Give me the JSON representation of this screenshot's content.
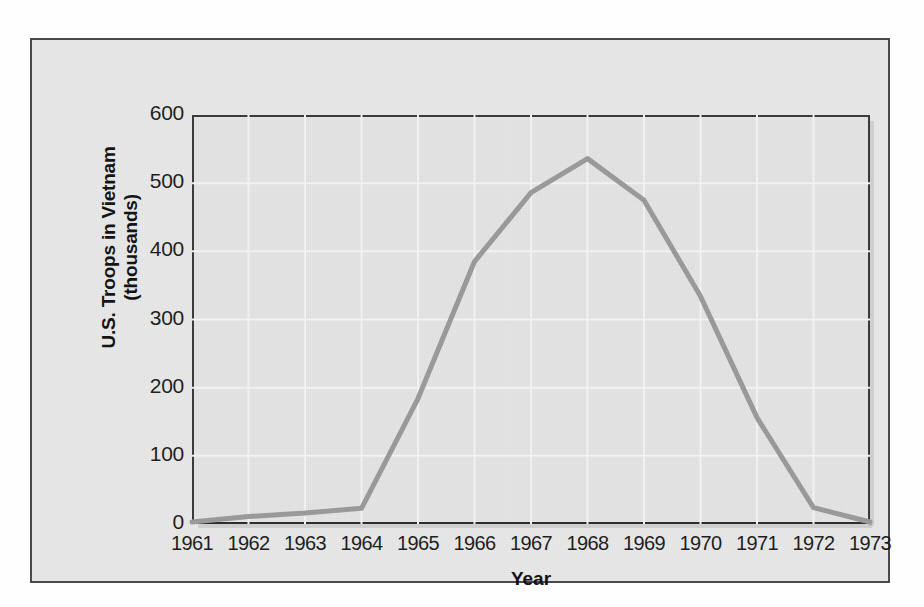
{
  "chart_data": {
    "type": "line",
    "title": "",
    "xlabel": "Year",
    "ylabel": "U.S. Troops in Vietnam (thousands)",
    "ylabel_line1": "U.S. Troops in Vietnam",
    "ylabel_line2": "(thousands)",
    "categories": [
      "1961",
      "1962",
      "1963",
      "1964",
      "1965",
      "1966",
      "1967",
      "1968",
      "1969",
      "1970",
      "1971",
      "1972",
      "1973"
    ],
    "x": [
      1961,
      1962,
      1963,
      1964,
      1965,
      1966,
      1967,
      1968,
      1969,
      1970,
      1971,
      1972,
      1973
    ],
    "values": [
      3,
      11,
      16,
      23,
      184,
      385,
      486,
      536,
      475,
      334,
      156,
      24,
      3
    ],
    "series": [
      {
        "name": "U.S. Troops in Vietnam",
        "values": [
          3,
          11,
          16,
          23,
          184,
          385,
          486,
          536,
          475,
          334,
          156,
          24,
          3
        ],
        "color": "#9a9a9a"
      }
    ],
    "ylim": [
      0,
      600
    ],
    "yticks": [
      0,
      100,
      200,
      300,
      400,
      500,
      600
    ],
    "ytick_labels": [
      "0",
      "100",
      "200",
      "300",
      "400",
      "500",
      "600"
    ],
    "xlim": [
      1961,
      1973
    ],
    "grid": true,
    "grid_color": "#f4f4f4",
    "legend": null,
    "legend_position": "none",
    "plot_background": "#e4e4e4",
    "figure_background": "#e8e8e8",
    "axis_color": "#3a3a3a",
    "line_width": 5,
    "annotations": []
  },
  "figure": {
    "frame_border_color": "#4a4a4a",
    "page_background": "#fefefe"
  }
}
